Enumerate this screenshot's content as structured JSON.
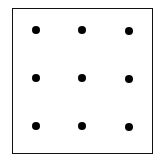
{
  "diagram": {
    "type": "nine-dot-grid",
    "frame": {
      "border_color": "#111111"
    },
    "dot_color": "#000000",
    "rows": 3,
    "cols": 3,
    "dots": [
      {
        "x": 36,
        "y": 30
      },
      {
        "x": 82,
        "y": 30
      },
      {
        "x": 129,
        "y": 31
      },
      {
        "x": 36,
        "y": 78
      },
      {
        "x": 82,
        "y": 78
      },
      {
        "x": 129,
        "y": 79
      },
      {
        "x": 36,
        "y": 126
      },
      {
        "x": 82,
        "y": 126
      },
      {
        "x": 129,
        "y": 127
      }
    ]
  }
}
